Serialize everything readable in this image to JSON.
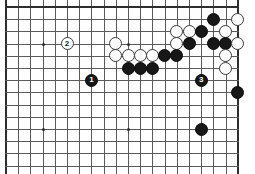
{
  "figure": {
    "kind": "go-board-diagram",
    "title": "",
    "board": {
      "columns": 20,
      "rows": 14,
      "origin_x": 6,
      "origin_y": 7,
      "spacing": 12.2,
      "line_color": "#5a5a5a",
      "edge_color": "#2e2e2e",
      "background_color": "#ffffff"
    },
    "edges": {
      "top": true,
      "left": true,
      "right": true,
      "bottom": false
    },
    "star_points": [
      {
        "col": 3,
        "row": 3
      },
      {
        "col": 10,
        "row": 3
      },
      {
        "col": 3,
        "row": 10
      },
      {
        "col": 10,
        "row": 10
      }
    ],
    "colors": {
      "black_stone": "#171717",
      "white_stone": "#fdfdfd",
      "black_label_text": "#ffffff",
      "white_label_text": "#1a1a1a"
    },
    "stones": [
      {
        "col": 9,
        "row": 3,
        "color": "white",
        "label": ""
      },
      {
        "col": 5,
        "row": 3,
        "color": "white",
        "label": "2"
      },
      {
        "col": 17,
        "row": 1,
        "color": "black",
        "label": ""
      },
      {
        "col": 19,
        "row": 1,
        "color": "white",
        "label": ""
      },
      {
        "col": 14,
        "row": 2,
        "color": "white",
        "label": ""
      },
      {
        "col": 15,
        "row": 2,
        "color": "white",
        "label": ""
      },
      {
        "col": 16,
        "row": 2,
        "color": "black",
        "label": ""
      },
      {
        "col": 18,
        "row": 2,
        "color": "white",
        "label": ""
      },
      {
        "col": 14,
        "row": 3,
        "color": "white",
        "label": ""
      },
      {
        "col": 15,
        "row": 3,
        "color": "black",
        "label": ""
      },
      {
        "col": 17,
        "row": 3,
        "color": "black",
        "label": ""
      },
      {
        "col": 18,
        "row": 3,
        "color": "black",
        "label": ""
      },
      {
        "col": 19,
        "row": 3,
        "color": "white",
        "label": ""
      },
      {
        "col": 9,
        "row": 4,
        "color": "white",
        "label": ""
      },
      {
        "col": 10,
        "row": 4,
        "color": "white",
        "label": ""
      },
      {
        "col": 11,
        "row": 4,
        "color": "white",
        "label": ""
      },
      {
        "col": 12,
        "row": 4,
        "color": "white",
        "label": ""
      },
      {
        "col": 13,
        "row": 4,
        "color": "black",
        "label": ""
      },
      {
        "col": 14,
        "row": 4,
        "color": "black",
        "label": ""
      },
      {
        "col": 18,
        "row": 4,
        "color": "white",
        "label": ""
      },
      {
        "col": 10,
        "row": 5,
        "color": "black",
        "label": ""
      },
      {
        "col": 11,
        "row": 5,
        "color": "black",
        "label": ""
      },
      {
        "col": 12,
        "row": 5,
        "color": "black",
        "label": ""
      },
      {
        "col": 18,
        "row": 5,
        "color": "white",
        "label": ""
      },
      {
        "col": 7,
        "row": 6,
        "color": "black",
        "label": "1"
      },
      {
        "col": 16,
        "row": 6,
        "color": "black",
        "label": "3"
      },
      {
        "col": 19,
        "row": 7,
        "color": "black",
        "label": ""
      },
      {
        "col": 16,
        "row": 10,
        "color": "black",
        "label": ""
      }
    ]
  }
}
